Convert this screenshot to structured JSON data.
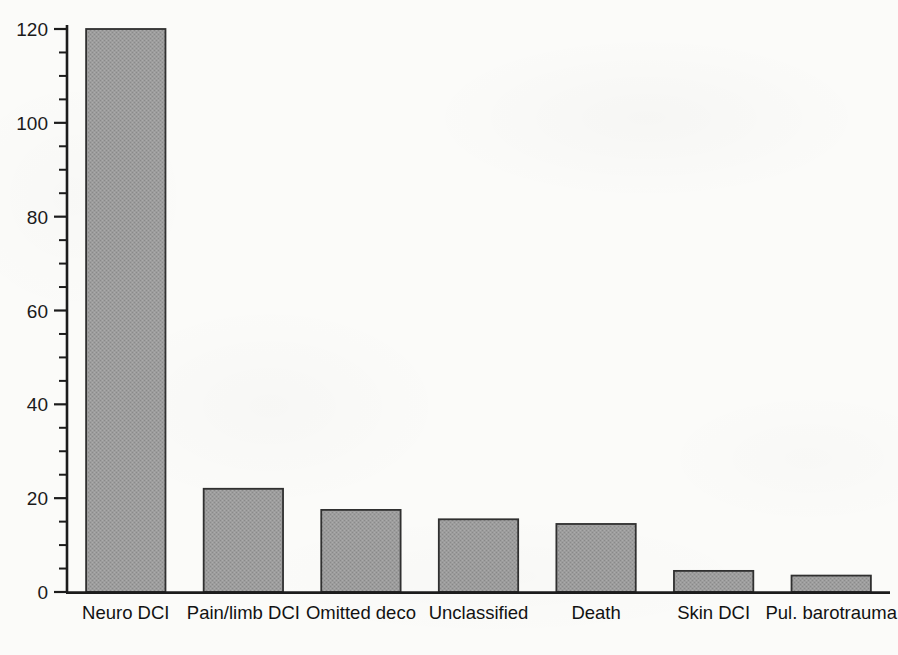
{
  "chart_data": {
    "type": "bar",
    "title": "",
    "subtitle": "",
    "xlabel": "",
    "ylabel": "",
    "categories": [
      "Neuro DCI",
      "Pain/limb DCI",
      "Omitted deco",
      "Unclassified",
      "Death",
      "Skin DCI",
      "Pul. barotrauma"
    ],
    "values": [
      120,
      22,
      17.5,
      15.5,
      14.5,
      4.5,
      3.5
    ],
    "ylim": [
      0,
      120
    ],
    "xlim": [
      0,
      7
    ],
    "y_major_ticks": [
      0,
      20,
      40,
      60,
      80,
      100,
      120
    ],
    "y_tick_labels": [
      "0",
      "20",
      "40",
      "60",
      "80",
      "100",
      "120"
    ],
    "y_minor_tick_interval": 5,
    "grid": false,
    "legend": null,
    "legend_position": "none",
    "annotations": [],
    "series": [
      {
        "name": "Count",
        "values": [
          120,
          22,
          17.5,
          15.5,
          14.5,
          4.5,
          3.5
        ]
      }
    ]
  },
  "style": {
    "bar_fill": "#9a9a9a",
    "bar_edge": "#303030",
    "axis_color": "#1c1c1c",
    "background": "#fbfbf9",
    "text_color": "#151515"
  },
  "axis": {
    "left_spine_visible": true,
    "bottom_spine_visible": true,
    "top_spine_visible": false,
    "right_spine_visible": false,
    "tick_direction": "out"
  }
}
